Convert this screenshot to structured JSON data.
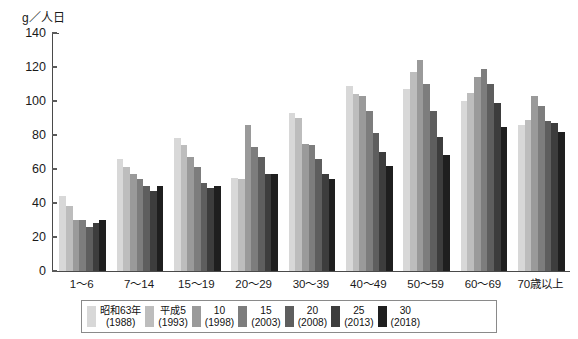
{
  "chart": {
    "type": "bar",
    "y_unit_label": "g／人日",
    "yaxis": {
      "ticks": [
        "0",
        "20",
        "40",
        "60",
        "80",
        "100",
        "120",
        "140"
      ],
      "min": 0,
      "max": 140
    }
  },
  "chart_data": {
    "type": "bar",
    "title": "",
    "subtitle": "",
    "xlabel": "",
    "ylabel": "g／人日",
    "ylim": [
      0,
      140
    ],
    "ytick_values": [
      0,
      20,
      40,
      60,
      80,
      100,
      120,
      140
    ],
    "grid": false,
    "legend_position": "bottom",
    "categories": [
      "1〜6",
      "7〜14",
      "15〜19",
      "20〜29",
      "30〜39",
      "40〜49",
      "50〜59",
      "60〜69",
      "70歳以上"
    ],
    "series": [
      {
        "name": "昭和63年",
        "name_line2": "(1988)",
        "color": "#d8d8d8",
        "values": [
          44,
          66,
          78,
          55,
          93,
          109,
          107,
          100,
          86
        ]
      },
      {
        "name": "平成5",
        "name_line2": "(1993)",
        "color": "#bdbdbd",
        "values": [
          38,
          61,
          74,
          54,
          90,
          104,
          117,
          105,
          89
        ]
      },
      {
        "name": "10",
        "name_line2": "(1998)",
        "color": "#9a9a9a",
        "values": [
          30,
          57,
          67,
          86,
          75,
          103,
          124,
          114,
          103
        ]
      },
      {
        "name": "15",
        "name_line2": "(2003)",
        "color": "#7d7d7d",
        "values": [
          30,
          54,
          61,
          73,
          74,
          94,
          110,
          119,
          97
        ]
      },
      {
        "name": "20",
        "name_line2": "(2008)",
        "color": "#5e5e5e",
        "values": [
          26,
          50,
          52,
          67,
          66,
          81,
          94,
          110,
          88
        ]
      },
      {
        "name": "25",
        "name_line2": "(2013)",
        "color": "#3d3d3d",
        "values": [
          28,
          47,
          49,
          57,
          57,
          70,
          79,
          99,
          87
        ]
      },
      {
        "name": "30",
        "name_line2": "(2018)",
        "color": "#1f1f1f",
        "values": [
          30,
          50,
          50,
          57,
          54,
          62,
          68,
          85,
          82
        ]
      }
    ]
  }
}
